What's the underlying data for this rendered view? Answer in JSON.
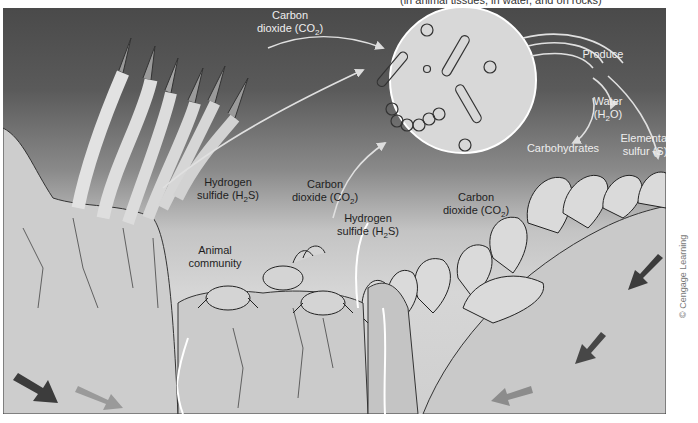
{
  "caption_fragment": "(in animal tissues, in water, and on rocks)",
  "labels": {
    "co2_top": {
      "line1": "Carbon",
      "line2": "dioxide (CO",
      "sub": "2",
      "end": ")"
    },
    "produce": "Produce",
    "water": {
      "line1": "Water",
      "line2": "(H",
      "sub": "2",
      "end": "O)"
    },
    "carbohydrates": "Carbohydrates",
    "sulfur": {
      "line1": "Elemental",
      "line2": "sulfur (S)"
    },
    "h2s_left": {
      "line1": "Hydrogen",
      "line2": "sulfide (H",
      "sub": "2",
      "end": "S)"
    },
    "co2_mid": {
      "line1": "Carbon",
      "line2": "dioxide (CO",
      "sub": "2",
      "end": ")"
    },
    "h2s_mid": {
      "line1": "Hydrogen",
      "line2": "sulfide (H",
      "sub": "2",
      "end": "S)"
    },
    "co2_right": {
      "line1": "Carbon",
      "line2": "dioxide (CO",
      "sub": "2",
      "end": ")"
    },
    "animal_community": {
      "line1": "Animal",
      "line2": "community"
    }
  },
  "elements": {
    "bacteria_circle": "bacteria-magnified-circle",
    "tubeworms": "tubeworm-cluster",
    "crabs": "crab-group",
    "mussels": "mussel-bed",
    "vent_flow_arrows": "water-flow-arrows"
  },
  "colors": {
    "sky_top": "#4a4a4a",
    "sediment": "#cfcfcf",
    "arrow_dark": "#3c3c3c",
    "arrow_light": "#8a8a8a",
    "label_light": "#eeeeee",
    "label_dark": "#1e1e1e"
  },
  "copyright": "© Cengage Learning"
}
